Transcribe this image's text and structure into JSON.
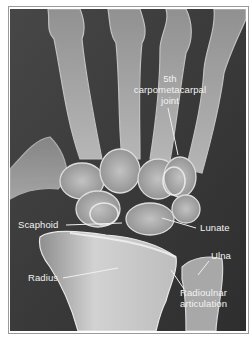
{
  "figure": {
    "colors": {
      "background": "#3a3a3a",
      "bone": "#c8c8c8",
      "bone_highlight": "#e6e6e6",
      "label_text": "#f2f2f2",
      "leader_line": "#f0f0f0",
      "frame_border": "#9a9a9a"
    },
    "labels": {
      "cmc_line1": "5th",
      "cmc_line2": "carpometacarpal",
      "cmc_line3": "joint",
      "scaphoid": "Scaphoid",
      "lunate": "Lunate",
      "radius": "Radius",
      "ulna": "Ulna",
      "radioulnar_line1": "Radioulnar",
      "radioulnar_line2": "articulation"
    }
  }
}
